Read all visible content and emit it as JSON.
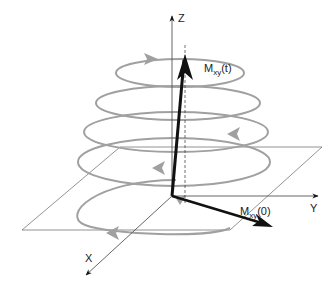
{
  "diagram": {
    "axes": {
      "z_label": "Z",
      "y_label": "Y",
      "x_label": "X"
    },
    "vectors": {
      "mt": {
        "main": "M",
        "sub": "xy",
        "arg": "(t)"
      },
      "m0": {
        "main": "M",
        "sub": "xy",
        "arg": "(0)"
      }
    },
    "colors": {
      "spiral": "#a0a0a0",
      "vector": "#111111",
      "axis": "#555555",
      "plane": "#666666"
    }
  }
}
